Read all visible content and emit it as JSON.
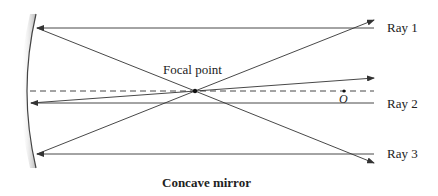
{
  "diagram": {
    "title": "Concave mirror",
    "labels": {
      "focal_point": "Focal point",
      "center": "O",
      "rays": [
        "Ray 1",
        "Ray 2",
        "Ray 3"
      ]
    },
    "colors": {
      "line": "#333333",
      "mirror_shade": "#bbbbbb",
      "background": "#ffffff"
    },
    "geometry": {
      "mirror": {
        "top": [
          36,
          14
        ],
        "vertex": [
          27,
          91
        ],
        "bottom": [
          36,
          168
        ]
      },
      "principal_axis_y": 91,
      "focal_point": [
        195,
        91
      ],
      "center_point": [
        355,
        91
      ],
      "rays": [
        {
          "name": "Ray 1",
          "incident_y": 28,
          "reflect_to": [
            374,
            20
          ]
        },
        {
          "name": "Ray 2",
          "incident_y": 103,
          "reflect_to": [
            374,
            78
          ]
        },
        {
          "name": "Ray 3",
          "incident_y": 154,
          "reflect_to": [
            374,
            163
          ]
        }
      ]
    }
  }
}
